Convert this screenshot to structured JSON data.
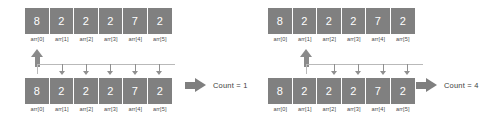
{
  "diagram": {
    "colors": {
      "cell_fill": "#808080",
      "cell_text": "#ffffff",
      "label_text": "#4a4a4a",
      "arrow": "#8a8a8a",
      "connector": "#b9b9b9",
      "block_arrow": "#7f7f7f",
      "background": "#ffffff"
    },
    "panels": [
      {
        "id": "step-1",
        "top_array": {
          "values": [
            "8",
            "2",
            "2",
            "2",
            "7",
            "2"
          ],
          "labels": [
            "arr[0]",
            "arr[1]",
            "arr[2]",
            "arr[3]",
            "arr[4]",
            "arr[5]"
          ]
        },
        "bottom_array": {
          "values": [
            "8",
            "2",
            "2",
            "2",
            "7",
            "2"
          ],
          "labels": [
            "arr[0]",
            "arr[1]",
            "arr[2]",
            "arr[3]",
            "arr[4]",
            "arr[5]"
          ]
        },
        "pointer_index": 0,
        "compare_indices": [
          1,
          2,
          3,
          4,
          5
        ],
        "result_label": "Count = 1"
      },
      {
        "id": "step-2",
        "top_array": {
          "values": [
            "8",
            "2",
            "2",
            "2",
            "7",
            "2"
          ],
          "labels": [
            "arr[0]",
            "arr[1]",
            "arr[2]",
            "arr[3]",
            "arr[4]",
            "arr[5]"
          ]
        },
        "bottom_array": {
          "values": [
            "8",
            "2",
            "2",
            "2",
            "7",
            "2"
          ],
          "labels": [
            "arr[0]",
            "arr[1]",
            "arr[2]",
            "arr[3]",
            "arr[4]",
            "arr[5]"
          ]
        },
        "pointer_index": 1,
        "compare_indices": [
          2,
          3,
          4,
          5
        ],
        "result_label": "Count = 4"
      }
    ]
  }
}
